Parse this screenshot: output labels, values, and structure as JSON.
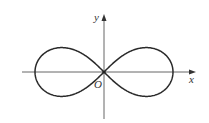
{
  "figure": {
    "type": "lemniscate",
    "labels": {
      "x_axis": "x",
      "y_axis": "y",
      "origin": "O"
    },
    "colors": {
      "curve": "#2a2a2a",
      "axes": "#555555",
      "background": "#ffffff"
    }
  }
}
